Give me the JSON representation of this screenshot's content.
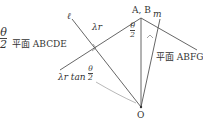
{
  "diagram": {
    "corner_fraction": {
      "num": "θ",
      "den": "2"
    },
    "plane_left": "平面 ABCDE",
    "plane_right": "平面 ABFGH",
    "line_l": "ℓ",
    "line_m": "m",
    "segment_label": "λr",
    "apex_label": "A, B",
    "apex_angle": {
      "num": "θ",
      "den": "2"
    },
    "tan_label": {
      "prefix": "λr tan",
      "num": "θ",
      "den": "2"
    },
    "origin_label": "O",
    "colors": {
      "line": "#444444",
      "text": "#333333",
      "background": "#ffffff"
    }
  }
}
